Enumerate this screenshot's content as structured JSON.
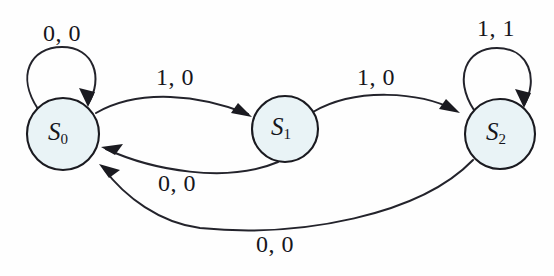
{
  "diagram": {
    "type": "state-transition-diagram",
    "background_color": "#fefefe",
    "node_fill_color": "#e9f3f6",
    "node_stroke_color": "#1a1a20",
    "edge_color": "#23232b",
    "label_color": "#16161c",
    "states": [
      {
        "id": "S0",
        "name": "S",
        "subscript": "0",
        "cx": 63,
        "cy": 134,
        "r": 36
      },
      {
        "id": "S1",
        "name": "S",
        "subscript": "1",
        "cx": 285,
        "cy": 129,
        "r": 33
      },
      {
        "id": "S2",
        "name": "S",
        "subscript": "2",
        "cx": 500,
        "cy": 134,
        "r": 35
      }
    ],
    "transitions": [
      {
        "id": "t-s0-self",
        "from": "S0",
        "to": "S0",
        "label": "0, 0",
        "label_x": 62,
        "label_y": 35,
        "kind": "self-loop"
      },
      {
        "id": "t-s0-s1",
        "from": "S0",
        "to": "S1",
        "label": "1, 0",
        "label_x": 175,
        "label_y": 79,
        "kind": "arc-upper"
      },
      {
        "id": "t-s1-s0",
        "from": "S1",
        "to": "S0",
        "label": "0, 0",
        "label_x": 177,
        "label_y": 185,
        "kind": "arc-lower"
      },
      {
        "id": "t-s1-s2",
        "from": "S1",
        "to": "S2",
        "label": "1, 0",
        "label_x": 376,
        "label_y": 79,
        "kind": "arc-upper"
      },
      {
        "id": "t-s2-self",
        "from": "S2",
        "to": "S2",
        "label": "1, 1",
        "label_x": 496,
        "label_y": 30,
        "kind": "self-loop"
      },
      {
        "id": "t-s2-s0",
        "from": "S2",
        "to": "S0",
        "label": "0, 0",
        "label_x": 275,
        "label_y": 246,
        "kind": "arc-long-lower"
      }
    ]
  }
}
